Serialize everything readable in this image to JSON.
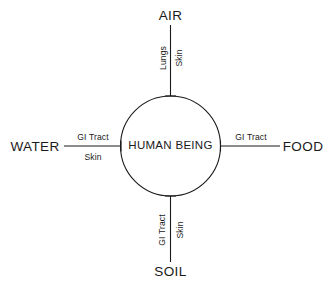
{
  "diagram": {
    "title_text": "HUMAN BEING",
    "center": {
      "label": "HUMAN BEING",
      "shape": "circle"
    },
    "nodes": [
      {
        "id": "air",
        "label": "AIR",
        "position": "top"
      },
      {
        "id": "water",
        "label": "WATER",
        "position": "left"
      },
      {
        "id": "food",
        "label": "FOOD",
        "position": "right"
      },
      {
        "id": "soil",
        "label": "SOIL",
        "position": "bottom"
      }
    ],
    "edges": [
      {
        "id": "air-edge",
        "from": "air",
        "to": "center",
        "orientation": "vertical",
        "routes": [
          {
            "label": "Lungs",
            "side": "left"
          },
          {
            "label": "Skin",
            "side": "right"
          }
        ]
      },
      {
        "id": "water-edge",
        "from": "water",
        "to": "center",
        "orientation": "horizontal",
        "routes": [
          {
            "label": "GI Tract",
            "side": "above"
          },
          {
            "label": "Skin",
            "side": "below"
          }
        ]
      },
      {
        "id": "food-edge",
        "from": "center",
        "to": "food",
        "orientation": "horizontal",
        "routes": [
          {
            "label": "GI Tract",
            "side": "above"
          }
        ]
      },
      {
        "id": "soil-edge",
        "from": "soil",
        "to": "center",
        "orientation": "vertical",
        "routes": [
          {
            "label": "GI Tract",
            "side": "left"
          },
          {
            "label": "Skin",
            "side": "right"
          }
        ]
      }
    ],
    "colors": {
      "background": "#ffffff",
      "stroke": "#1a1a1a",
      "text": "#1a1a1a"
    }
  }
}
